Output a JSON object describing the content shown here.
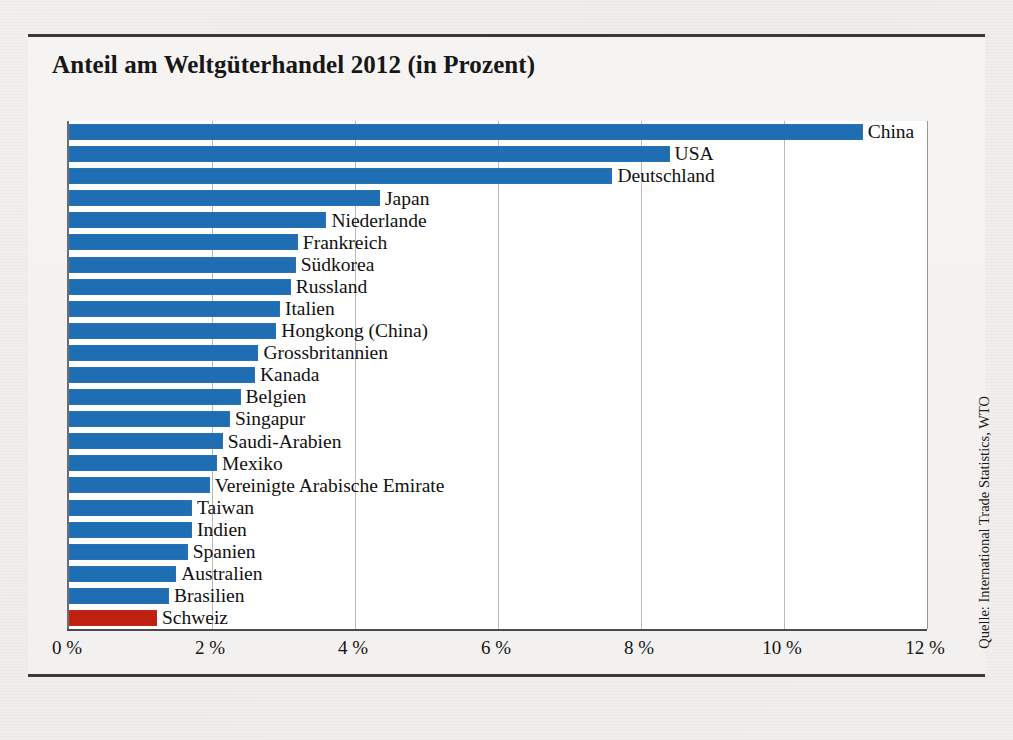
{
  "figure": {
    "title": "Anteil am Weltgüterhandel 2012 (in Prozent)",
    "source": "Quelle: International Trade Statistics, WTO",
    "bar_color": "#1f6eb4",
    "highlight_color": "#bf2011"
  },
  "chart_data": {
    "type": "bar",
    "orientation": "horizontal",
    "title": "Anteil am Weltgüterhandel 2012 (in Prozent)",
    "xlabel": "",
    "ylabel": "",
    "xlim": [
      0,
      12
    ],
    "xticks": [
      0,
      2,
      4,
      6,
      8,
      10,
      12
    ],
    "xtick_labels": [
      "0 %",
      "2 %",
      "4 %",
      "6 %",
      "8 %",
      "10 %",
      "12 %"
    ],
    "grid": true,
    "legend": false,
    "unit": "%",
    "highlight_category": "Schweiz",
    "categories": [
      "China",
      "USA",
      "Deutschland",
      "Japan",
      "Niederlande",
      "Frankreich",
      "Südkorea",
      "Russland",
      "Italien",
      "Hongkong (China)",
      "Grossbritannien",
      "Kanada",
      "Belgien",
      "Singapur",
      "Saudi-Arabien",
      "Mexiko",
      "Vereinigte Arabische Emirate",
      "Taiwan",
      "Indien",
      "Spanien",
      "Australien",
      "Brasilien",
      "Schweiz"
    ],
    "values": [
      11.1,
      8.4,
      7.6,
      4.35,
      3.6,
      3.2,
      3.17,
      3.1,
      2.95,
      2.9,
      2.65,
      2.6,
      2.4,
      2.25,
      2.15,
      2.07,
      1.97,
      1.72,
      1.72,
      1.66,
      1.5,
      1.4,
      1.23
    ]
  }
}
